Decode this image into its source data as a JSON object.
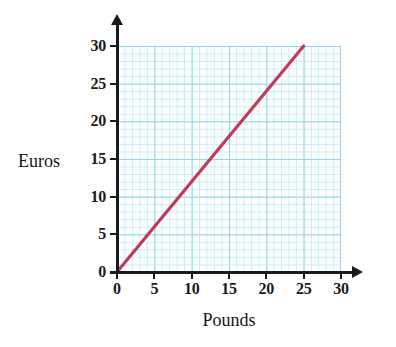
{
  "chart_data": {
    "type": "line",
    "title": "",
    "xlabel": "Pounds",
    "ylabel": "Euros",
    "xlim": [
      0,
      30
    ],
    "ylim": [
      0,
      30
    ],
    "xticks": [
      "0",
      "5",
      "10",
      "15",
      "20",
      "25",
      "30"
    ],
    "yticks": [
      "0",
      "5",
      "10",
      "15",
      "20",
      "25",
      "30"
    ],
    "xtick_values": [
      0,
      5,
      10,
      15,
      20,
      25,
      30
    ],
    "ytick_values": [
      0,
      5,
      10,
      15,
      20,
      25,
      30
    ],
    "grid": true,
    "minor_grid": true,
    "minor_grid_divisions": 5,
    "legend": "none",
    "series": [
      {
        "name": "conversion-line",
        "color": "#c13a5a",
        "x": [
          0,
          25
        ],
        "y": [
          0,
          30
        ],
        "slope": 1.2,
        "intercept": 0,
        "points": [
          {
            "x": 0,
            "y": 0
          },
          {
            "x": 5,
            "y": 6
          },
          {
            "x": 10,
            "y": 12
          },
          {
            "x": 15,
            "y": 18
          },
          {
            "x": 20,
            "y": 24
          },
          {
            "x": 25,
            "y": 30
          }
        ]
      }
    ],
    "colors": {
      "line": "#c13a5a",
      "major_grid": "#8ed8ec",
      "minor_grid": "#c9ecf6",
      "axis": "#1a1a1a",
      "plot_background": "#fdffff",
      "page_background": "#ffffff"
    }
  },
  "axes": {
    "x_title": "Pounds",
    "y_title": "Euros"
  }
}
